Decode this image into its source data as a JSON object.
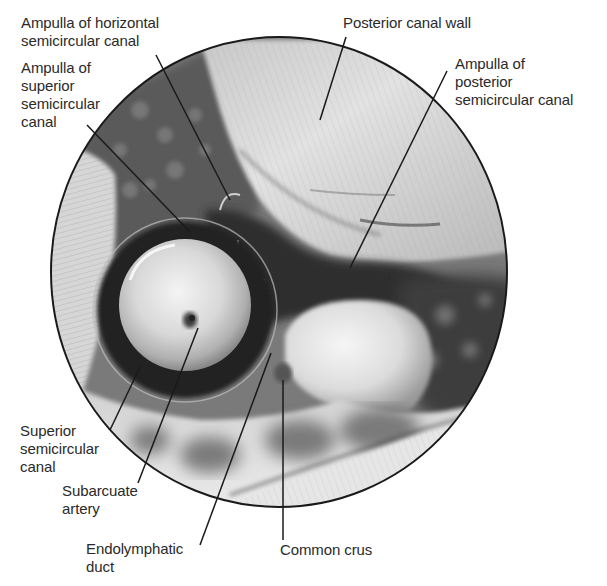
{
  "figure": {
    "type": "anatomical-endoscopic-view",
    "colors": {
      "background": "#ffffff",
      "outline": "#1a1a1a",
      "leader": "#1a1a1a",
      "label_text": "#2a2a2a"
    },
    "labels": [
      {
        "id": "ampulla-horizontal",
        "lines": [
          "Ampulla of horizontal",
          "semicircular canal"
        ],
        "pos": {
          "x": 21,
          "y": 14
        },
        "leader": {
          "x1": 156,
          "y1": 55,
          "x2": 230,
          "y2": 200
        }
      },
      {
        "id": "ampulla-superior",
        "lines": [
          "Ampulla of",
          "superior",
          "semicircular",
          "canal"
        ],
        "pos": {
          "x": 21,
          "y": 59
        },
        "leader": {
          "x1": 87,
          "y1": 125,
          "x2": 190,
          "y2": 232
        }
      },
      {
        "id": "posterior-canal-wall",
        "lines": [
          "Posterior canal wall"
        ],
        "pos": {
          "x": 343,
          "y": 14
        },
        "leader": {
          "x1": 346,
          "y1": 37,
          "x2": 320,
          "y2": 120
        }
      },
      {
        "id": "ampulla-posterior",
        "lines": [
          "Ampulla of",
          "posterior",
          "semicircular canal"
        ],
        "pos": {
          "x": 455,
          "y": 55
        },
        "leader": {
          "x1": 447,
          "y1": 71,
          "x2": 350,
          "y2": 268
        }
      },
      {
        "id": "superior-semicircular-canal",
        "lines": [
          "Superior",
          "semicircular",
          "canal"
        ],
        "pos": {
          "x": 20,
          "y": 422
        },
        "leader": {
          "x1": 110,
          "y1": 430,
          "x2": 140,
          "y2": 367
        }
      },
      {
        "id": "subarcuate-artery",
        "lines": [
          "Subarcuate",
          "artery"
        ],
        "pos": {
          "x": 62,
          "y": 482
        },
        "leader": {
          "x1": 138,
          "y1": 483,
          "x2": 198,
          "y2": 328
        }
      },
      {
        "id": "endolymphatic-duct",
        "lines": [
          "Endolymphatic",
          "duct"
        ],
        "pos": {
          "x": 86,
          "y": 540
        },
        "leader": {
          "x1": 200,
          "y1": 545,
          "x2": 271,
          "y2": 353
        }
      },
      {
        "id": "common-crus",
        "lines": [
          "Common crus"
        ],
        "pos": {
          "x": 280,
          "y": 541
        },
        "leader": {
          "x1": 283,
          "y1": 540,
          "x2": 283,
          "y2": 380
        }
      }
    ],
    "view_circle": {
      "cx": 279,
      "cy": 272,
      "rx": 228,
      "ry": 235
    }
  }
}
